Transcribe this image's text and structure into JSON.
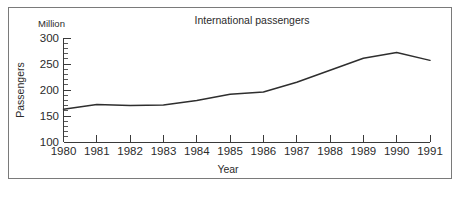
{
  "chart_data": {
    "type": "line",
    "title": "International passengers",
    "xlabel": "Year",
    "ylabel": "Passengers",
    "yunit": "Million",
    "x": [
      1980,
      1981,
      1982,
      1983,
      1984,
      1985,
      1986,
      1987,
      1988,
      1989,
      1990,
      1991
    ],
    "categories": [
      "1980",
      "1981",
      "1982",
      "1983",
      "1984",
      "1985",
      "1986",
      "1987",
      "1988",
      "1989",
      "1990",
      "1991"
    ],
    "values": [
      163,
      172,
      170,
      171,
      180,
      192,
      196,
      215,
      238,
      261,
      272,
      257
    ],
    "series": [
      {
        "name": "International passengers",
        "values": [
          163,
          172,
          170,
          171,
          180,
          192,
          196,
          215,
          238,
          261,
          272,
          257
        ]
      }
    ],
    "xlim": [
      1980,
      1991
    ],
    "ylim": [
      100,
      300
    ],
    "ytick_labels": [
      "300",
      "250",
      "200",
      "150",
      "100"
    ],
    "yticks": [
      300,
      250,
      200,
      150,
      100
    ],
    "yminor_step": 10,
    "grid": false,
    "legend": "none",
    "line_color": "#2e2e2e",
    "axis_color": "#3a3a3a",
    "background_color": "#ffffff"
  },
  "axes": {
    "y_unit_label": "Million",
    "y_axis_title": "Passengers",
    "x_axis_title": "Year",
    "y_tick_0": "300",
    "y_tick_1": "250",
    "y_tick_2": "200",
    "y_tick_3": "150",
    "y_tick_4": "100",
    "x_tick_0": "1980",
    "x_tick_1": "1981",
    "x_tick_2": "1982",
    "x_tick_3": "1983",
    "x_tick_4": "1984",
    "x_tick_5": "1985",
    "x_tick_6": "1986",
    "x_tick_7": "1987",
    "x_tick_8": "1988",
    "x_tick_9": "1989",
    "x_tick_10": "1990",
    "x_tick_11": "1991"
  },
  "header": {
    "title": "International passengers"
  }
}
